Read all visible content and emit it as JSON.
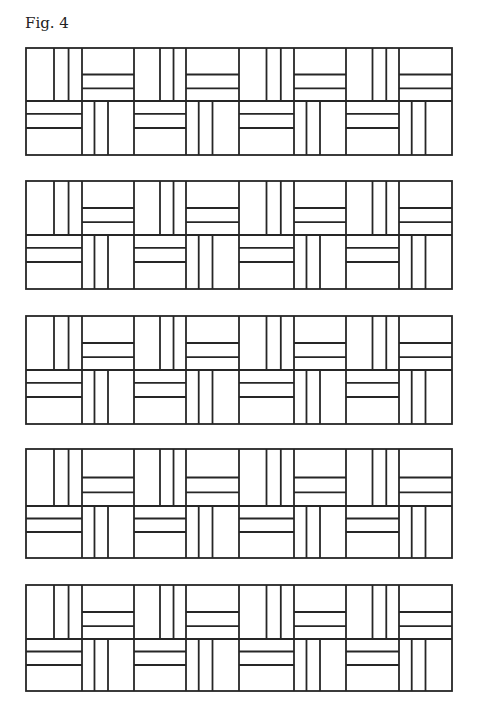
{
  "caption": "Fig. 4",
  "pattern": {
    "x_edges": [
      26,
      82,
      134,
      186,
      239,
      294,
      346,
      399,
      452
    ],
    "rows": [
      {
        "top": 48,
        "mid": 101,
        "bottom": 155
      },
      {
        "top": 181,
        "mid": 235,
        "bottom": 289
      },
      {
        "top": 316,
        "mid": 370,
        "bottom": 424
      },
      {
        "top": 449,
        "mid": 506,
        "bottom": 558
      },
      {
        "top": 585,
        "mid": 639,
        "bottom": 691
      }
    ],
    "top_half_cells": [
      "V",
      "H",
      "V",
      "H",
      "V",
      "H",
      "V",
      "H"
    ],
    "bottom_half_cells": [
      "H",
      "V",
      "H",
      "V",
      "H",
      "V",
      "H",
      "V"
    ],
    "stroke_color": "#262626"
  }
}
